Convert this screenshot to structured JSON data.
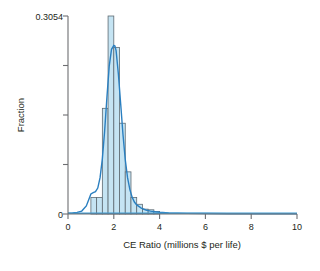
{
  "chart_data": {
    "type": "bar",
    "title": "",
    "subtitle": "",
    "xlabel": "CE Ratio (millions $ per life)",
    "ylabel": "Fraction",
    "xlim": [
      0,
      10
    ],
    "ylim": [
      0,
      0.3054
    ],
    "grid": false,
    "legend": null,
    "xticks": [
      0,
      2,
      4,
      6,
      8,
      10
    ],
    "xtick_labels": [
      "0",
      "2",
      "4",
      "6",
      "8",
      "10"
    ],
    "yticks": [
      0,
      0.3054
    ],
    "ytick_labels": [
      "0",
      "0.3054"
    ],
    "ytick_minor": [
      0.07635,
      0.1527,
      0.22905
    ],
    "bin_width": 0.25,
    "bin_starts": [
      1.0,
      1.25,
      1.5,
      1.75,
      2.0,
      2.25,
      2.5,
      2.75,
      3.0,
      3.25,
      3.5,
      3.75
    ],
    "values": [
      0.0255,
      0.0255,
      0.163,
      0.3054,
      0.257,
      0.14,
      0.065,
      0.0255,
      0.015,
      0.0075,
      0.0065,
      0.004
    ],
    "series": [
      {
        "name": "Histogram",
        "values": [
          0.0255,
          0.0255,
          0.163,
          0.3054,
          0.257,
          0.14,
          0.065,
          0.0255,
          0.015,
          0.0075,
          0.0065,
          0.004
        ]
      },
      {
        "name": "Kernel density",
        "x": [
          0.0,
          0.2,
          0.4,
          0.6,
          0.8,
          0.9,
          1.0,
          1.1,
          1.2,
          1.3,
          1.4,
          1.5,
          1.6,
          1.7,
          1.8,
          1.9,
          2.0,
          2.05,
          2.1,
          2.2,
          2.3,
          2.4,
          2.5,
          2.6,
          2.7,
          2.8,
          2.9,
          3.0,
          3.2,
          3.4,
          3.6,
          3.8,
          4.0,
          4.4,
          4.8,
          5.2,
          6.0,
          7.0,
          8.0,
          9.0,
          10.0
        ],
        "y": [
          0.0012,
          0.0016,
          0.0025,
          0.0045,
          0.0125,
          0.0215,
          0.031,
          0.033,
          0.0345,
          0.04,
          0.056,
          0.085,
          0.128,
          0.18,
          0.228,
          0.254,
          0.26,
          0.259,
          0.252,
          0.216,
          0.17,
          0.123,
          0.084,
          0.056,
          0.038,
          0.026,
          0.0185,
          0.014,
          0.009,
          0.0062,
          0.0045,
          0.0034,
          0.0027,
          0.0018,
          0.0013,
          0.001,
          0.0007,
          0.0005,
          0.0004,
          0.0004,
          0.0003
        ]
      }
    ],
    "colors": {
      "bar_fill": "#c5e4f3",
      "bar_stroke": "#5e6a72",
      "curve": "#2a7fc0",
      "axis": "#6d6e71",
      "text": "#231f20"
    }
  }
}
